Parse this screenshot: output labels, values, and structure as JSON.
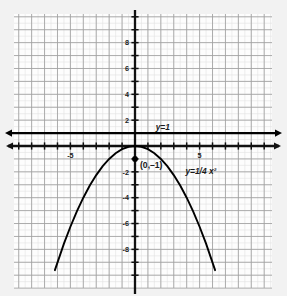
{
  "figure": {
    "background_color": "#f2f2f2",
    "plot_background_color": "#fdfdfd",
    "grid_major_color": "#a0a0a0",
    "grid_minor_color": "#e2e2e2",
    "axis_color": "#111111",
    "curve_color": "#000000"
  },
  "axes": {
    "x_label_visible": [
      {
        "value": -5,
        "text": "-5"
      },
      {
        "value": 5,
        "text": "5"
      }
    ],
    "y_label_visible": [
      {
        "value": 8,
        "text": "8"
      },
      {
        "value": 6,
        "text": "6"
      },
      {
        "value": 4,
        "text": "4"
      },
      {
        "value": 2,
        "text": "2"
      },
      {
        "value": -2,
        "text": "-2"
      },
      {
        "value": -4,
        "text": "-4"
      },
      {
        "value": -6,
        "text": "-6"
      },
      {
        "value": -8,
        "text": "-8"
      }
    ],
    "xlim": [
      -9.4,
      10.6
    ],
    "ylim": [
      -10.2,
      10.2
    ],
    "tick_step": 1,
    "label_step": 2,
    "grid": true,
    "minor_grid": true
  },
  "annotations": {
    "line_label": "y=1",
    "curve_label": "y=1/4  x²",
    "point_label": "(0,–1)"
  },
  "chart_data": {
    "type": "line",
    "title": "",
    "xlabel": "",
    "ylabel": "",
    "xlim": [
      -9.4,
      10.6
    ],
    "ylim": [
      -10.2,
      10.2
    ],
    "grid": true,
    "legend": "none",
    "series": [
      {
        "name": "y=1/4 x²",
        "label": "y=1/4  x²",
        "type": "parabola-downward",
        "equation": "y = -1/4 x^2",
        "vertex": [
          0,
          0
        ],
        "color": "#000000",
        "x": [
          -6.2,
          -5.5,
          -5,
          -4.5,
          -4,
          -3.5,
          -3,
          -2.5,
          -2,
          -1.5,
          -1,
          -0.5,
          0,
          0.5,
          1,
          1.5,
          2,
          2.5,
          3,
          3.5,
          4,
          4.5,
          5,
          5.5,
          6.2
        ],
        "y": [
          -9.61,
          -7.56,
          -6.25,
          -5.06,
          -4,
          -3.06,
          -2.25,
          -1.56,
          -1,
          -0.56,
          -0.25,
          -0.06,
          0,
          -0.06,
          -0.25,
          -0.56,
          -1,
          -1.56,
          -2.25,
          -3.06,
          -4,
          -5.06,
          -6.25,
          -7.56,
          -9.61
        ]
      },
      {
        "name": "y=1",
        "label": "y=1",
        "type": "horizontal-line",
        "equation": "y = 1",
        "y_value": 1,
        "color": "#000000",
        "arrows": "both"
      }
    ],
    "points": [
      {
        "label": "(0,–1)",
        "x": 0,
        "y": -1,
        "marker": "filled-circle",
        "color": "#000000"
      }
    ]
  }
}
